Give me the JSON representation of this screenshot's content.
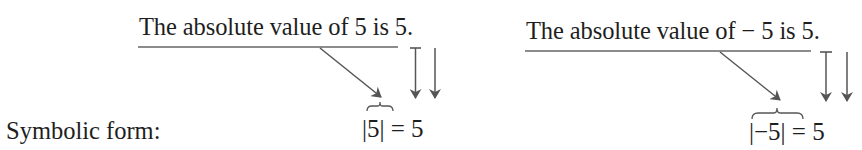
{
  "label": "Symbolic form:",
  "examples": [
    {
      "sentence": "The absolute value of 5 is 5.",
      "expression": "|5| = 5"
    },
    {
      "sentence": "The absolute value of − 5 is 5.",
      "expression": "|−5| = 5"
    }
  ],
  "colors": {
    "text": "#1e1e1e",
    "arrow": "#555555",
    "underline": "#666666"
  }
}
